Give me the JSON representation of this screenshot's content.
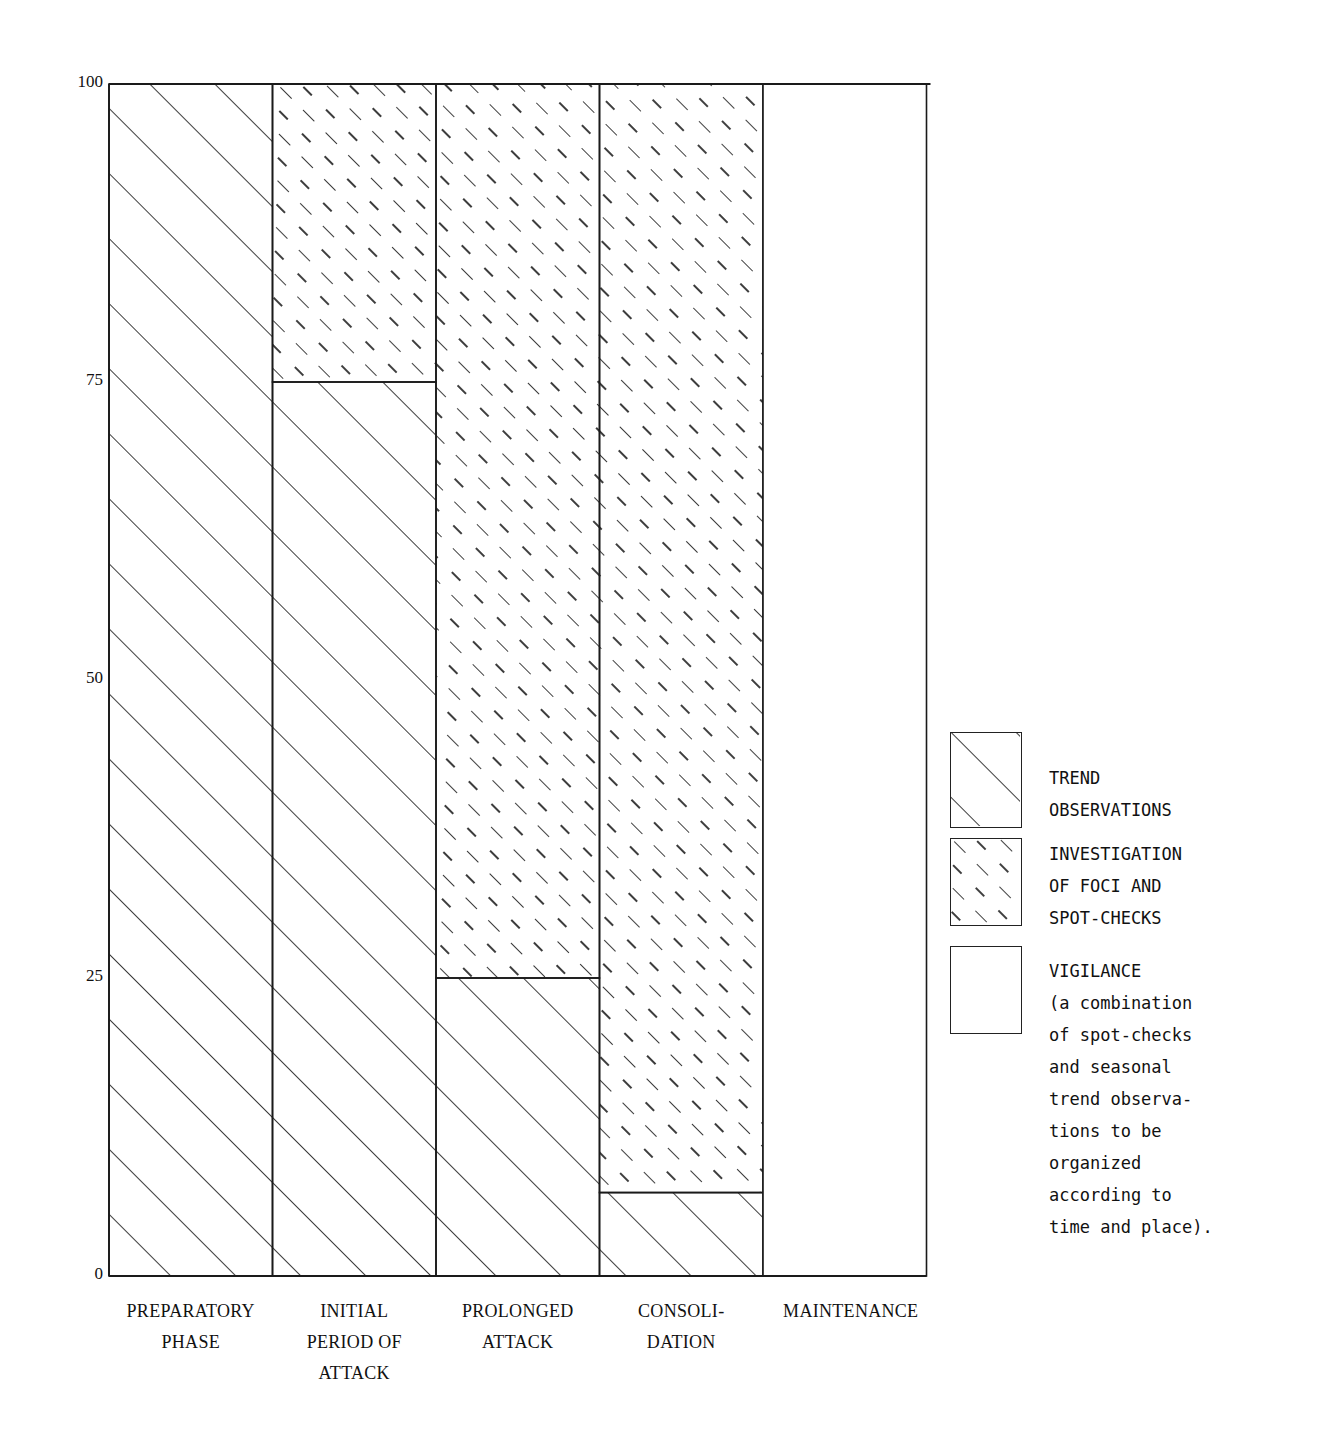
{
  "chart_data": {
    "type": "bar",
    "stacked": true,
    "title": "",
    "xlabel": "",
    "ylabel": "",
    "ylim": [
      0,
      100
    ],
    "yticks": [
      0,
      25,
      50,
      75,
      100
    ],
    "ytick_labels": [
      "0",
      "25",
      "50",
      "75",
      "100"
    ],
    "categories": [
      [
        "PREPARATORY",
        "PHASE"
      ],
      [
        "INITIAL",
        "PERIOD OF",
        "ATTACK"
      ],
      [
        "PROLONGED",
        "ATTACK"
      ],
      [
        "CONSOLI-",
        "DATION"
      ],
      [
        "MAINTENANCE"
      ]
    ],
    "category_names": [
      "PREPARATORY PHASE",
      "INITIAL PERIOD OF ATTACK",
      "PROLONGED ATTACK",
      "CONSOLIDATION",
      "MAINTENANCE"
    ],
    "series": [
      {
        "name": "TREND OBSERVATIONS",
        "pattern": "solid-hatch",
        "values": [
          100,
          75,
          25,
          7,
          0
        ]
      },
      {
        "name": "INVESTIGATION OF FOCI AND SPOT-CHECKS",
        "pattern": "dashed-hatch",
        "values": [
          0,
          25,
          75,
          93,
          0
        ]
      },
      {
        "name": "VIGILANCE",
        "pattern": "blank",
        "values": [
          0,
          0,
          0,
          0,
          100
        ]
      }
    ],
    "grid": false,
    "legend_position": "right"
  },
  "legend": {
    "items": [
      {
        "key": "trend",
        "lines": [
          "TREND",
          "OBSERVATIONS"
        ]
      },
      {
        "key": "investigation",
        "lines": [
          "INVESTIGATION",
          "OF FOCI AND",
          "SPOT-CHECKS"
        ]
      },
      {
        "key": "vigilance",
        "lines": [
          "VIGILANCE",
          "(a combination",
          "of spot-checks",
          "and seasonal",
          "trend observa-",
          "tions to be",
          "organized",
          "according to",
          "time and place)."
        ]
      }
    ]
  },
  "colors": {
    "ink": "#1a1a1a",
    "paper": "#ffffff"
  }
}
